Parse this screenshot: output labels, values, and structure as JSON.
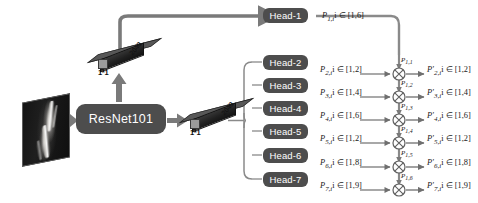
{
  "diagram": {
    "input": {
      "name": "xray-input-image",
      "description": "grayscale radiograph of a lower limb"
    },
    "backbone": {
      "label": "ResNet101"
    },
    "conv_blocks": [
      {
        "id": "conv-top",
        "kernel_label": "1*1",
        "channel_label": "2048"
      },
      {
        "id": "conv-mid",
        "kernel_label": "1*1",
        "channel_label": "2048"
      }
    ],
    "heads": [
      {
        "label": "Head-1",
        "output": "P",
        "sub": "1,i",
        "range": "i ∈ [1,6]"
      },
      {
        "label": "Head-2",
        "output": "P",
        "sub": "2,i",
        "range": "i ∈ [1,2]"
      },
      {
        "label": "Head-3",
        "output": "P",
        "sub": "3,i",
        "range": "i ∈ [1,4]"
      },
      {
        "label": "Head-4",
        "output": "P",
        "sub": "4,i",
        "range": "i ∈ [1,6]"
      },
      {
        "label": "Head-5",
        "output": "P",
        "sub": "5,i",
        "range": "i ∈ [1,2]"
      },
      {
        "label": "Head-6",
        "output": "P",
        "sub": "6,i",
        "range": "i ∈ [1,8]"
      },
      {
        "label": "Head-7",
        "output": "P",
        "sub": "7,i",
        "range": "i ∈ [1,9]"
      }
    ],
    "bus_labels": [
      {
        "text": "P",
        "sub": "1,1"
      },
      {
        "text": "P",
        "sub": "1,2"
      },
      {
        "text": "P",
        "sub": "1,3"
      },
      {
        "text": "P",
        "sub": "1,4"
      },
      {
        "text": "P",
        "sub": "1,5"
      },
      {
        "text": "P",
        "sub": "1,6"
      }
    ],
    "operators": [
      {
        "symbol": "⊗",
        "name": "multiply"
      },
      {
        "symbol": "⊗",
        "name": "multiply"
      },
      {
        "symbol": "⊗",
        "name": "multiply"
      },
      {
        "symbol": "⊗",
        "name": "multiply"
      },
      {
        "symbol": "⊗",
        "name": "multiply"
      },
      {
        "symbol": "⊗",
        "name": "multiply"
      }
    ],
    "outputs": [
      {
        "output": "P′",
        "sub": "2,i",
        "range": "i ∈ [1,2]"
      },
      {
        "output": "P′",
        "sub": "3,i",
        "range": "i ∈ [1,4]"
      },
      {
        "output": "P′",
        "sub": "4,i",
        "range": "i ∈ [1,6]"
      },
      {
        "output": "P′",
        "sub": "5,i",
        "range": "i ∈ [1,2]"
      },
      {
        "output": "P′",
        "sub": "6,i",
        "range": "i ∈ [1,8]"
      },
      {
        "output": "P′",
        "sub": "7,i",
        "range": "i ∈ [1,9]"
      }
    ],
    "colors": {
      "block_fill": "#4d4d4d",
      "arrow": "#7a7a7a",
      "thin_line": "#8a8a8a",
      "text_dark": "#1a1a1a",
      "text_light": "#ffffff"
    }
  }
}
